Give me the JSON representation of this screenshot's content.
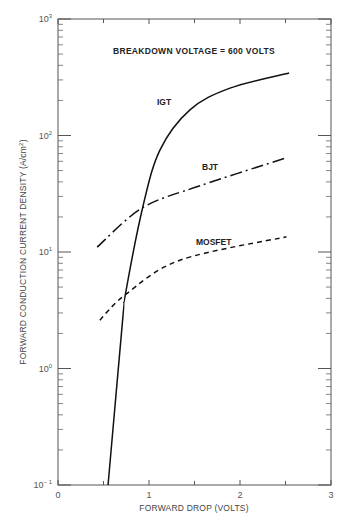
{
  "chart_data": {
    "type": "line",
    "title": "BREAKDOWN VOLTAGE = 600 VOLTS",
    "xlabel": "FORWARD DROP (VOLTS)",
    "ylabel": "FORWARD CONDUCTION CURRENT DENSITY (A/cm²)",
    "xlim": [
      0,
      3
    ],
    "ylim": [
      0.1,
      1000
    ],
    "yscale": "log",
    "grid": false,
    "legend": "inline labels",
    "x_ticks": [
      "0",
      "1",
      "2",
      "3"
    ],
    "y_ticks": [
      {
        "base": "10",
        "exp": "3"
      },
      {
        "base": "10",
        "exp": "2"
      },
      {
        "base": "10",
        "exp": "1"
      },
      {
        "base": "10",
        "exp": "0"
      },
      {
        "base": "10",
        "exp": "− 1"
      }
    ],
    "series": [
      {
        "name": "IGT",
        "style": "solid",
        "x": [
          0.55,
          0.71,
          0.74,
          0.93,
          1.12,
          1.45,
          1.89,
          2.54
        ],
        "y": [
          0.1,
          2.6,
          4.3,
          24,
          75,
          166,
          255,
          344
        ]
      },
      {
        "name": "BJT",
        "style": "dash-dot",
        "x": [
          0.43,
          0.93,
          1.56,
          2.5
        ],
        "y": [
          11,
          24,
          37,
          64
        ]
      },
      {
        "name": "MOSFET",
        "style": "dashed",
        "x": [
          0.46,
          0.74,
          1.34,
          2.51
        ],
        "y": [
          2.6,
          4.3,
          8.5,
          13.5
        ]
      }
    ]
  },
  "labels": {
    "title": "BREAKDOWN VOLTAGE = 600 VOLTS",
    "xlabel": "FORWARD DROP (VOLTS)",
    "ylabel_main": "FORWARD CONDUCTION CURRENT DENSITY (A/cm",
    "ylabel_sup": "2",
    "ylabel_end": ")",
    "igt": "IGT",
    "bjt": "BJT",
    "mosfet": "MOSFET"
  }
}
